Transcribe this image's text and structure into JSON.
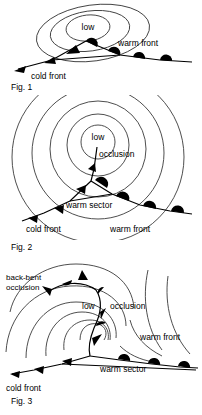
{
  "caption": "Depression evolution",
  "colors": {
    "background": "#ffffff",
    "isobar": "#3a3a3a",
    "front": "#000000",
    "text": "#000000"
  },
  "figures": [
    {
      "id": "fig1",
      "number": "Fig. 1",
      "stage": "wave-cyclone",
      "labels": {
        "low": "low",
        "cold_front": "cold front",
        "warm_front": "warm front"
      }
    },
    {
      "id": "fig2",
      "number": "Fig. 2",
      "stage": "occluding-cyclone",
      "labels": {
        "low": "low",
        "occlusion": "occlusion",
        "warm_sector": "warm sector",
        "cold_front": "cold front",
        "warm_front": "warm front"
      }
    },
    {
      "id": "fig3",
      "number": "Fig. 3",
      "stage": "mature-occlusion",
      "labels": {
        "low": "low",
        "occlusion": "occlusion",
        "back_bent_occlusion_line1": "back-bent",
        "back_bent_occlusion_line2": "occlusion",
        "warm_sector": "warm sector",
        "cold_front": "cold front",
        "warm_front": "warm front"
      }
    }
  ],
  "legend_symbols": {
    "cold_front_glyph": "filled-triangle",
    "warm_front_glyph": "filled-semicircle",
    "occlusion_glyph": "alternating-triangle-semicircle",
    "isobar_glyph": "closed-contour-line"
  }
}
